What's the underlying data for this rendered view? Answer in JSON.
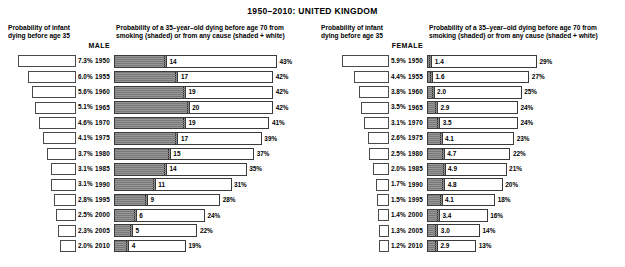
{
  "title": "1950–2010:  UNITED KINGDOM",
  "headers": {
    "infant": "Probability of infant dying before age 35",
    "infant_line1": "Probability of infant",
    "infant_line2": "dying before age 35",
    "bars_line1": "Probability of a 35–year–old dying before age 70 from",
    "bars_line2": "smoking (shaded) or from any cause (shaded + white)",
    "male": "MALE",
    "female": "FEMALE"
  },
  "colors": {
    "smoking_shade": "#828282",
    "bar_outline": "#3a3a3a",
    "background": "#ffffff",
    "text": "#000000"
  },
  "chart_data": {
    "type": "bar",
    "title": "1950–2010:  UNITED KINGDOM",
    "xlabel": "",
    "ylabel": "",
    "categories": [
      1950,
      1955,
      1960,
      1965,
      1970,
      1975,
      1980,
      1985,
      1990,
      1995,
      2000,
      2005,
      2010
    ],
    "panels": [
      {
        "sex": "MALE",
        "infant_label": "Probability of infant dying before age 35",
        "infant_unit": "%",
        "infant_values": [
          7.3,
          6.0,
          5.6,
          5.1,
          4.6,
          4.1,
          3.7,
          3.1,
          3.1,
          2.8,
          2.5,
          2.3,
          2.0
        ],
        "infant_display": [
          "7.3%",
          "6.0%",
          "5.6%",
          "5.1%",
          "4.6%",
          "4.1%",
          "3.7%",
          "3.1%",
          "3.1%",
          "2.8%",
          "2.5%",
          "2.3%",
          "2.0%"
        ],
        "bars_label": "Probability of a 35-year-old dying before age 70 from smoking (shaded) or from any cause (shaded + white)",
        "smoking_values": [
          14,
          17,
          19,
          20,
          19,
          17,
          15,
          14,
          11,
          9,
          6,
          5,
          4
        ],
        "smoking_display": [
          "14",
          "17",
          "19",
          "20",
          "19",
          "17",
          "15",
          "14",
          "11",
          "9",
          "6",
          "5",
          "4"
        ],
        "total_values": [
          43,
          42,
          42,
          42,
          41,
          39,
          37,
          35,
          31,
          28,
          24,
          22,
          19
        ],
        "total_display": [
          "43%",
          "42%",
          "42%",
          "42%",
          "41%",
          "39%",
          "37%",
          "35%",
          "31%",
          "28%",
          "24%",
          "22%",
          "19%"
        ]
      },
      {
        "sex": "FEMALE",
        "infant_label": "Probability of infant dying before age 35",
        "infant_unit": "%",
        "infant_values": [
          5.9,
          4.4,
          3.8,
          3.5,
          3.1,
          2.6,
          2.5,
          2.0,
          1.7,
          1.5,
          1.4,
          1.3,
          1.2
        ],
        "infant_display": [
          "5.9%",
          "4.4%",
          "3.8%",
          "3.5%",
          "3.1%",
          "2.6%",
          "2.5%",
          "2.0%",
          "1.7%",
          "1.5%",
          "1.4%",
          "1.3%",
          "1.2%"
        ],
        "bars_label": "Probability of a 35-year-old dying before age 70 from smoking (shaded) or from any cause (shaded + white)",
        "smoking_values": [
          1.4,
          1.6,
          2.0,
          2.9,
          3.5,
          4.1,
          4.7,
          4.9,
          4.8,
          4.1,
          3.4,
          3.0,
          2.9
        ],
        "smoking_display": [
          "1.4",
          "1.6",
          "2.0",
          "2.9",
          "3.5",
          "4.1",
          "4.7",
          "4.9",
          "4.8",
          "4.1",
          "3.4",
          "3.0",
          "2.9"
        ],
        "total_values": [
          29,
          27,
          25,
          24,
          24,
          23,
          22,
          21,
          20,
          18,
          16,
          14,
          13
        ],
        "total_display": [
          "29%",
          "27%",
          "25%",
          "24%",
          "24%",
          "23%",
          "22%",
          "21%",
          "20%",
          "18%",
          "16%",
          "14%",
          "13%"
        ]
      }
    ],
    "axis_ranges": {
      "infant_max_pct": 7.3,
      "total_max_pct": 43
    },
    "grid": false,
    "legend": "inline: shaded = smoking, shaded + white = any cause"
  }
}
